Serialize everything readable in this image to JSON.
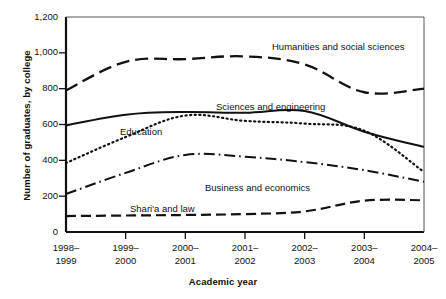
{
  "chart_data": {
    "type": "line",
    "title": "",
    "xlabel": "Academic year",
    "ylabel": "Number of graduates, by college",
    "categories": [
      "1998–1999",
      "1999–2000",
      "2000–2001",
      "2001–2002",
      "2002–2003",
      "2003–2004",
      "2004–2005"
    ],
    "category_lines": [
      [
        "1998–",
        "1999"
      ],
      [
        "1999–",
        "2000"
      ],
      [
        "2000–",
        "2001"
      ],
      [
        "2001–",
        "2002"
      ],
      [
        "2002–",
        "2003"
      ],
      [
        "2003–",
        "2004"
      ],
      [
        "2004–",
        "2005"
      ]
    ],
    "ylim": [
      0,
      1200
    ],
    "yticks": [
      0,
      200,
      400,
      600,
      800,
      1000,
      1200
    ],
    "ytick_labels": [
      "0",
      "200",
      "400",
      "600",
      "800",
      "1,000",
      "1,200"
    ],
    "grid": false,
    "legend": "inline-labels",
    "series": [
      {
        "name": "Humanities and social sciences",
        "style": "dashed",
        "values": [
          790,
          950,
          965,
          980,
          935,
          780,
          800
        ],
        "label_x": 272,
        "label_y": 41
      },
      {
        "name": "Sciences and engineering",
        "style": "solid",
        "values": [
          595,
          655,
          670,
          665,
          675,
          560,
          475
        ],
        "label_x": 216,
        "label_y": 101
      },
      {
        "name": "Education",
        "style": "dotted",
        "values": [
          385,
          530,
          650,
          620,
          605,
          565,
          335
        ],
        "label_x": 120,
        "label_y": 126
      },
      {
        "name": "Business and economics",
        "style": "dash-dot",
        "values": [
          212,
          330,
          430,
          420,
          390,
          345,
          280
        ],
        "label_x": 205,
        "label_y": 182
      },
      {
        "name": "Shari'a and law",
        "style": "long-dash",
        "values": [
          89,
          92,
          95,
          100,
          115,
          175,
          177
        ],
        "label_x": 130,
        "label_y": 203
      }
    ]
  }
}
